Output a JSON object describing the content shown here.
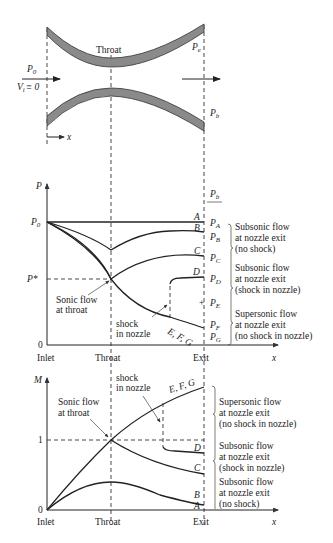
{
  "nozzle": {
    "throat_label": "Throat",
    "p0_label": "P",
    "p0_sub": "0",
    "vi_label": "V",
    "vi_sub": "i",
    "vi_eq": "≡ 0",
    "pe_label": "P",
    "pe_sub": "e",
    "pb_label": "P",
    "pb_sub": "b",
    "x_label": "x"
  },
  "pressure_plot": {
    "y_axis_label": "P",
    "x_axis_label": "x",
    "p0_tick": "P",
    "p0_tick_sub": "0",
    "pstar_tick": "P*",
    "zero_tick": "0",
    "x_ticks": [
      "Inlet",
      "Throat",
      "Exit"
    ],
    "pb_header": "P",
    "pb_header_sub": "b",
    "curve_labels": [
      "A",
      "B",
      "C",
      "D",
      "E, F, G"
    ],
    "exit_pressures": [
      {
        "main": "P",
        "sub": "A"
      },
      {
        "main": "P",
        "sub": "B"
      },
      {
        "main": "P",
        "sub": "C"
      },
      {
        "main": "P",
        "sub": "D"
      },
      {
        "main": "P",
        "sub": "E"
      },
      {
        "main": "P",
        "sub": "F"
      },
      {
        "main": "P",
        "sub": "G"
      }
    ],
    "annotations": {
      "sonic_line1": "Sonic flow",
      "sonic_line2": "at throat",
      "shock_line1": "shock",
      "shock_line2": "in nozzle"
    },
    "regimes": [
      {
        "line1": "Subsonic flow",
        "line2": "at nozzle exit",
        "line3": "(no shock)"
      },
      {
        "line1": "Subsonic flow",
        "line2": "at nozzle exit",
        "line3": "(shock in nozzle)"
      },
      {
        "line1": "Supersonic flow",
        "line2": "at nozzle exit",
        "line3": "(no shock in nozzle)"
      }
    ]
  },
  "mach_plot": {
    "y_axis_label": "M",
    "x_axis_label": "x",
    "one_tick": "1",
    "zero_tick": "0",
    "x_ticks": [
      "Inlet",
      "Throat",
      "Exit"
    ],
    "curve_labels": [
      "E, F, G",
      "D",
      "C",
      "B",
      "A"
    ],
    "annotations": {
      "sonic_line1": "Sonic flow",
      "sonic_line2": "at throat",
      "shock_line1": "shock",
      "shock_line2": "in nozzle"
    },
    "regimes": [
      {
        "line1": "Supersonic flow",
        "line2": "at nozzle exit",
        "line3": "(no shock in nozzle)"
      },
      {
        "line1": "Subsonic flow",
        "line2": "at nozzle exit",
        "line3": "(shock in nozzle)"
      },
      {
        "line1": "Subsonic flow",
        "line2": "at nozzle exit",
        "line3": "(no shock)"
      }
    ]
  }
}
